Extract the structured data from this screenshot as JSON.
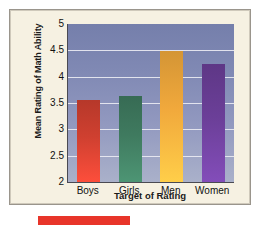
{
  "chart_data": {
    "type": "bar",
    "title": "",
    "xlabel": "Target of Rating",
    "ylabel": "Mean Rating of Math Ability",
    "categories": [
      "Boys",
      "Girls",
      "Men",
      "Women"
    ],
    "values": [
      3.55,
      3.64,
      4.48,
      4.25
    ],
    "ylim": [
      2,
      5
    ],
    "yticks": [
      "2",
      "2.5",
      "3",
      "3.5",
      "4",
      "4.5",
      "5"
    ],
    "ytick_values": [
      2,
      2.5,
      3,
      3.5,
      4,
      4.5,
      5
    ],
    "grid": true,
    "legend": "none",
    "bar_colors": [
      "#cf4030",
      "#3f7a5f",
      "#f1a93c",
      "#6b3f98"
    ],
    "plot_background_top": "#757fab",
    "plot_background_bottom": "#aab1ca",
    "gridline_color": "#e9eaf2",
    "series": [
      {
        "name": "Mean Rating of Math Ability",
        "points": [
          {
            "category": "Boys",
            "value": 3.55,
            "color": "#cf4030"
          },
          {
            "category": "Girls",
            "value": 3.64,
            "color": "#3f7a5f"
          },
          {
            "category": "Men",
            "value": 4.48,
            "color": "#f1a93c"
          },
          {
            "category": "Women",
            "value": 4.25,
            "color": "#6b3f98"
          }
        ]
      }
    ]
  },
  "figure": {
    "card_background": "#f6f1e2",
    "card_border": "#9a958c",
    "accent_color": "#e8352a"
  }
}
